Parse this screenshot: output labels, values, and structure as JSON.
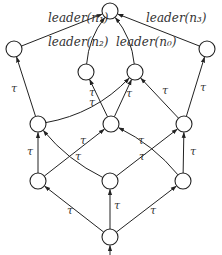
{
  "diagram": {
    "title": "",
    "nodes": [
      {
        "id": "top",
        "label": ""
      },
      {
        "id": "l2a",
        "label": ""
      },
      {
        "id": "l2b",
        "label": ""
      },
      {
        "id": "l3a",
        "label": ""
      },
      {
        "id": "l3b",
        "label": ""
      },
      {
        "id": "l4a",
        "label": ""
      },
      {
        "id": "l4b",
        "label": ""
      },
      {
        "id": "l4c",
        "label": ""
      },
      {
        "id": "l5a",
        "label": ""
      },
      {
        "id": "l5b",
        "label": ""
      },
      {
        "id": "l5c",
        "label": ""
      },
      {
        "id": "root",
        "label": ""
      }
    ],
    "edges": [
      {
        "from": "l2a",
        "to": "top",
        "label": "leader(n₁)"
      },
      {
        "from": "l3a",
        "to": "top",
        "label": "leader(n₂)"
      },
      {
        "from": "l3b",
        "to": "top",
        "label": "leader(n₀)"
      },
      {
        "from": "l2b",
        "to": "top",
        "label": "leader(n₃)"
      },
      {
        "from": "l4a",
        "to": "l2a",
        "label": "τ"
      },
      {
        "from": "l4a",
        "to": "l3b",
        "label": "τ"
      },
      {
        "from": "l4b",
        "to": "l3a",
        "label": "τ"
      },
      {
        "from": "l4b",
        "to": "l3b",
        "label": "τ"
      },
      {
        "from": "l4c",
        "to": "l3b",
        "label": "τ"
      },
      {
        "from": "l4c",
        "to": "l2b",
        "label": "τ"
      },
      {
        "from": "l5a",
        "to": "l4a",
        "label": "τ"
      },
      {
        "from": "l5a",
        "to": "l4b",
        "label": "τ"
      },
      {
        "from": "l5b",
        "to": "l4a",
        "label": "τ"
      },
      {
        "from": "l5b",
        "to": "l4c",
        "label": "τ"
      },
      {
        "from": "l5c",
        "to": "l4b",
        "label": "τ"
      },
      {
        "from": "l5c",
        "to": "l4c",
        "label": "τ"
      },
      {
        "from": "root",
        "to": "l5a",
        "label": "τ"
      },
      {
        "from": "root",
        "to": "l5b",
        "label": "τ"
      },
      {
        "from": "root",
        "to": "l5c",
        "label": "τ"
      }
    ],
    "entry_arrow": {
      "to": "root"
    }
  }
}
